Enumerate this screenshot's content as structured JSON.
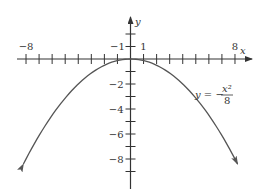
{
  "chart_data": {
    "type": "line",
    "title": "",
    "xlabel": "x",
    "ylabel": "y",
    "equation": "y = -x^2/8",
    "equation_label": {
      "lhs": "y = −",
      "num": "x²",
      "den": "8"
    },
    "xlim": [
      -8.3,
      9.3
    ],
    "ylim": [
      -10.4,
      3.3
    ],
    "x_tick_labels": [
      {
        "value": -8,
        "label": "−8"
      },
      {
        "value": -1,
        "label": "−1"
      },
      {
        "value": 1,
        "label": "1"
      },
      {
        "value": 8,
        "label": "8"
      }
    ],
    "y_tick_labels": [
      {
        "value": -2,
        "label": "−2"
      },
      {
        "value": -4,
        "label": "−4"
      },
      {
        "value": -6,
        "label": "−6"
      },
      {
        "value": -8,
        "label": "−8"
      }
    ],
    "x_ticks": [
      -8,
      -7,
      -6,
      -5,
      -4,
      -3,
      -2,
      -1,
      1,
      2,
      3,
      4,
      5,
      6,
      7,
      8
    ],
    "y_ticks": [
      2,
      1,
      -1,
      -2,
      -3,
      -4,
      -5,
      -6,
      -7,
      -8,
      -9
    ],
    "series": [
      {
        "name": "y = -x^2/8",
        "x": [
          -8.2,
          -8,
          -6,
          -4,
          -2,
          0,
          2,
          4,
          6,
          8,
          8.2
        ],
        "y": [
          -8.405,
          -8,
          -4.5,
          -2,
          -0.5,
          0,
          -0.5,
          -2,
          -4.5,
          -8,
          -8.405
        ]
      }
    ],
    "grid": false,
    "legend": "none",
    "colors": {
      "axis": "#333333",
      "curve": "#555555"
    }
  }
}
